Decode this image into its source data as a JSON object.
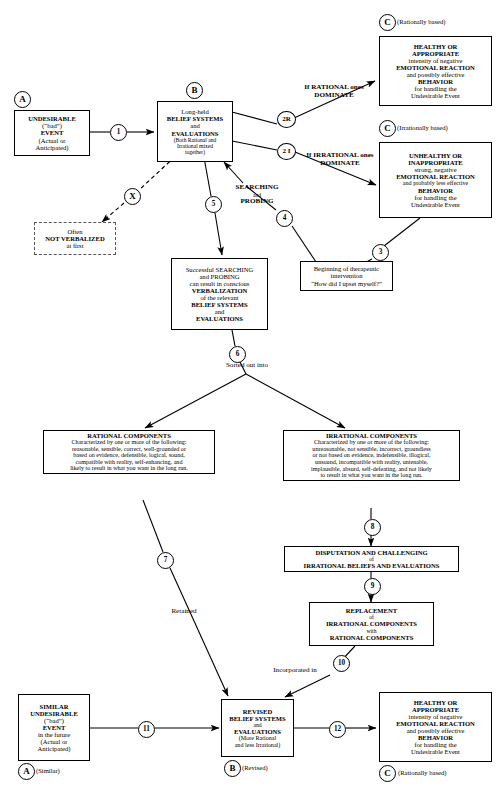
{
  "diagram": {
    "nodes": {
      "a_event": {
        "marker": "A",
        "lines": [
          {
            "t": "UNDESIRABLE",
            "bold": true
          },
          {
            "t": "(“bad”)",
            "bold": false
          },
          {
            "t": "EVENT",
            "bold": true
          },
          {
            "t": "(Actual or",
            "bold": false
          },
          {
            "t": "Anticipated)",
            "bold": false
          }
        ]
      },
      "b_beliefs": {
        "marker": "B",
        "lines": [
          {
            "t": "Long-held",
            "bold": false
          },
          {
            "t": "BELIEF SYSTEMS",
            "bold": true
          },
          {
            "t": "and",
            "bold": false
          },
          {
            "t": "EVALUATIONS",
            "bold": true
          },
          {
            "t": "(Both Rational and",
            "bold": false
          },
          {
            "t": "Irrational mixed",
            "bold": false
          },
          {
            "t": "together)",
            "bold": false
          }
        ]
      },
      "c_healthy": {
        "marker": "C",
        "marker_note": "(Rationally based)",
        "lines": [
          {
            "t": "HEALTHY OR",
            "bold": true
          },
          {
            "t": "APPROPRIATE",
            "bold": true
          },
          {
            "t": "intensity of negative",
            "bold": false
          },
          {
            "t": "EMOTIONAL REACTION",
            "bold": true
          },
          {
            "t": "and possibly effective",
            "bold": false
          },
          {
            "t": "BEHAVIOR",
            "bold": true
          },
          {
            "t": "for handling the",
            "bold": false
          },
          {
            "t": "Undesirable Event",
            "bold": false
          }
        ]
      },
      "c_unhealthy": {
        "marker": "C",
        "marker_note": "(Irrationally based)",
        "lines": [
          {
            "t": "UNHEALTHY OR",
            "bold": true
          },
          {
            "t": "INAPPROPRIATE",
            "bold": true
          },
          {
            "t": "strong, negative",
            "bold": false
          },
          {
            "t": "EMOTIONAL REACTION",
            "bold": true
          },
          {
            "t": "and probably less effective",
            "bold": false
          },
          {
            "t": "BEHAVIOR",
            "bold": true
          },
          {
            "t": "for handling the",
            "bold": false
          },
          {
            "t": "Undesirable Event",
            "bold": false
          }
        ]
      },
      "not_verbalized": {
        "lines": [
          {
            "t": "Often",
            "bold": false
          },
          {
            "t": "NOT VERBALIZED",
            "bold": true
          },
          {
            "t": "at first",
            "bold": false
          }
        ]
      },
      "verbalization": {
        "lines": [
          {
            "t": "Successful SEARCHING",
            "bold": false
          },
          {
            "t": "and PROBING",
            "bold": false
          },
          {
            "t": "can result in conscious",
            "bold": false
          },
          {
            "t": "VERBALIZATION",
            "bold": true
          },
          {
            "t": "of the relevant",
            "bold": false
          },
          {
            "t": "BELIEF SYSTEMS",
            "bold": true
          },
          {
            "t": "and",
            "bold": false
          },
          {
            "t": "EVALUATIONS",
            "bold": true
          }
        ]
      },
      "therapeutic": {
        "lines": [
          {
            "t": "Beginning of therapeutic",
            "bold": false
          },
          {
            "t": "intervention",
            "bold": false
          },
          {
            "t": "“How did I upset myself?”",
            "bold": false
          }
        ]
      },
      "rational_components": {
        "heading": "RATIONAL COMPONENTS",
        "lines": [
          {
            "t": "Characterized by one or more of the following:",
            "bold": false
          },
          {
            "t": "reasonable, sensible, correct, well-grounded or",
            "bold": false
          },
          {
            "t": "based on evidence, defensible, logical, sound,",
            "bold": false
          },
          {
            "t": "compatible with reality, self-enhancing, and",
            "bold": false
          },
          {
            "t": "likely to result in what you want in the long run.",
            "bold": false
          }
        ]
      },
      "irrational_components": {
        "heading": "IRRATIONAL COMPONENTS",
        "lines": [
          {
            "t": "Characterized by one or more of the following:",
            "bold": false
          },
          {
            "t": "unreasonable, not sensible, incorrect, groundless",
            "bold": false
          },
          {
            "t": "or not based on evidence, indefensible, illogical,",
            "bold": false
          },
          {
            "t": "unsound, incompatible with reality, untenable,",
            "bold": false
          },
          {
            "t": "implausible, absurd, self-defeating, and not likely",
            "bold": false
          },
          {
            "t": "to result in what you want in the long run.",
            "bold": false
          }
        ]
      },
      "disputation": {
        "lines": [
          {
            "t": "DISPUTATION AND CHALLENGING",
            "bold": true
          },
          {
            "t": "of",
            "bold": false
          },
          {
            "t": "IRRATIONAL BELIEFS AND EVALUATIONS",
            "bold": true
          }
        ]
      },
      "replacement": {
        "lines": [
          {
            "t": "REPLACEMENT",
            "bold": true
          },
          {
            "t": "of",
            "bold": false
          },
          {
            "t": "IRRATIONAL COMPONENTS",
            "bold": true
          },
          {
            "t": "with",
            "bold": false
          },
          {
            "t": "RATIONAL COMPONENTS",
            "bold": true
          }
        ]
      },
      "similar_event": {
        "marker": "A",
        "marker_note": "(Similar)",
        "lines": [
          {
            "t": "SIMILAR",
            "bold": true
          },
          {
            "t": "UNDESIRABLE",
            "bold": true
          },
          {
            "t": "(“bad”)",
            "bold": false
          },
          {
            "t": "EVENT",
            "bold": true
          },
          {
            "t": "in the future",
            "bold": false
          },
          {
            "t": "(Actual or",
            "bold": false
          },
          {
            "t": "Anticipated)",
            "bold": false
          }
        ]
      },
      "revised_beliefs": {
        "marker": "B",
        "marker_note": "(Revised)",
        "lines": [
          {
            "t": "REVISED",
            "bold": true
          },
          {
            "t": "BELIEF SYSTEMS",
            "bold": true
          },
          {
            "t": "and",
            "bold": false
          },
          {
            "t": "EVALUATIONS",
            "bold": true
          },
          {
            "t": "(More Rational",
            "bold": false
          },
          {
            "t": "and less Irrational)",
            "bold": false
          }
        ]
      },
      "final_healthy": {
        "marker": "C",
        "marker_note": "(Rationally based)",
        "lines": [
          {
            "t": "HEALTHY OR",
            "bold": true
          },
          {
            "t": "APPROPRIATE",
            "bold": true
          },
          {
            "t": "intensity of negative",
            "bold": false
          },
          {
            "t": "EMOTIONAL REACTION",
            "bold": true
          },
          {
            "t": "and possibly effective",
            "bold": false
          },
          {
            "t": "BEHAVIOR",
            "bold": true
          },
          {
            "t": "for handling the",
            "bold": false
          },
          {
            "t": "Undesirable Event",
            "bold": false
          }
        ]
      }
    },
    "edge_markers": {
      "e1": "1",
      "e2r": "2R",
      "e2i": "2 I",
      "e3": "3",
      "e4": "4",
      "e5": "5",
      "e6": "6",
      "e7": "7",
      "e8": "8",
      "e9": "9",
      "e10": "10",
      "e11": "11",
      "e12": "12",
      "ex": "X"
    },
    "edge_labels": {
      "if_rational": [
        "If RATIONAL ones",
        "DOMINATE"
      ],
      "if_irrational": [
        "If IRRATIONAL ones",
        "DOMINATE"
      ],
      "searching_probing": [
        "SEARCHING",
        "and",
        "PROBING"
      ],
      "sorted_out_into": "Sorted out into",
      "retained": "Retained",
      "incorporated_in": "Incorporated in"
    }
  }
}
